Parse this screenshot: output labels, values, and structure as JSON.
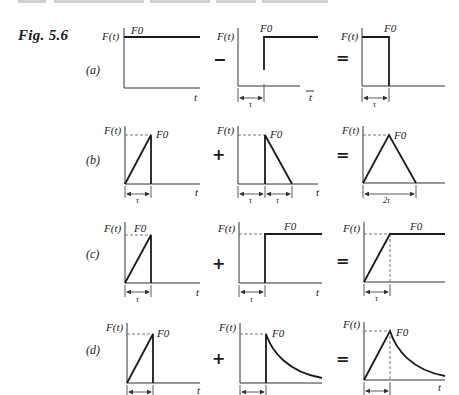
{
  "header": {
    "running_head": "illegible cropped running header"
  },
  "figure": {
    "label": "Fig. 5.6",
    "y_axis_label": "F(t)",
    "x_axis_label": "t",
    "amplitude_label": "F0",
    "duration_label": "τ",
    "double_duration_label": "2τ"
  },
  "rows": [
    {
      "label": "(a)",
      "operator": "−",
      "equals": "=",
      "panels": [
        "constant step F0 from t=0",
        "step F0 delayed by τ",
        "rectangular pulse of height F0, width τ"
      ]
    },
    {
      "label": "(b)",
      "operator": "+",
      "equals": "=",
      "panels": [
        "ramp to F0 over τ then drop",
        "drop to F0 at τ then linear decay over τ",
        "triangular pulse of width 2τ"
      ]
    },
    {
      "label": "(c)",
      "operator": "+",
      "equals": "=",
      "panels": [
        "ramp to F0 over τ then drop",
        "step F0 delayed by τ",
        "ramp to F0 over τ then constant"
      ]
    },
    {
      "label": "(d)",
      "operator": "+",
      "equals": "=",
      "panels": [
        "ramp to F0 over τ then drop",
        "jump to F0 at τ then exponential decay",
        "ramp to F0 over τ then exponential decay"
      ]
    }
  ]
}
